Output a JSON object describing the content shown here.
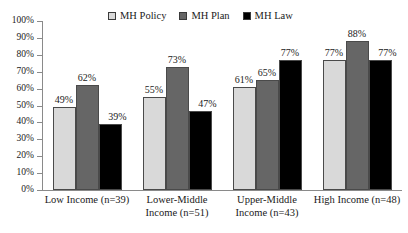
{
  "chart_data": {
    "type": "bar",
    "title": "",
    "subtitle": "",
    "xlabel": "",
    "ylabel": "",
    "ylim": [
      0,
      100
    ],
    "ytick_labels": [
      "100%",
      "90%",
      "80%",
      "70%",
      "60%",
      "50%",
      "40%",
      "30%",
      "20%",
      "10%",
      "0%"
    ],
    "ytick_values": [
      100,
      90,
      80,
      70,
      60,
      50,
      40,
      30,
      20,
      10,
      0
    ],
    "grid": false,
    "legend_position": "top-center",
    "value_suffix": "%",
    "categories": [
      "Low Income (n=39)",
      "Lower-Middle Income (n=51)",
      "Upper-Middle Income (n=43)",
      "High Income (n=48)"
    ],
    "category_lines": [
      [
        "Low Income (n=39)"
      ],
      [
        "Lower-Middle",
        "Income (n=51)"
      ],
      [
        "Upper-Middle",
        "Income (n=43)"
      ],
      [
        "High Income (n=48)"
      ]
    ],
    "series": [
      {
        "name": "MH Policy",
        "color": "#d9d9d9",
        "values": [
          49,
          55,
          61,
          77
        ],
        "labels": [
          "49%",
          "55%",
          "61%",
          "77%"
        ]
      },
      {
        "name": "MH Plan",
        "color": "#666666",
        "values": [
          62,
          73,
          65,
          88
        ],
        "labels": [
          "62%",
          "73%",
          "65%",
          "88%"
        ]
      },
      {
        "name": "MH Law",
        "color": "#000000",
        "values": [
          39,
          47,
          77,
          77
        ],
        "labels": [
          "39%",
          "47%",
          "77%",
          "77%"
        ]
      }
    ]
  },
  "legend": {
    "entries": [
      {
        "label": "MH Policy",
        "swatch": "#d9d9d9"
      },
      {
        "label": "MH Plan",
        "swatch": "#666666"
      },
      {
        "label": "MH Law",
        "swatch": "#000000"
      }
    ]
  },
  "axis": {
    "tick_color": "#8a8a8a"
  }
}
